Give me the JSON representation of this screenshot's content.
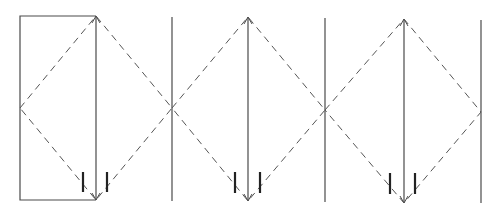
{
  "diagram": {
    "type": "geometric-line-diagram",
    "colors": {
      "line": "#4a4a4a",
      "dashed": "#555555",
      "tick": "#222222",
      "background": "#ffffff"
    },
    "rectangle": {
      "x1": 20,
      "y1": 16,
      "x2": 96,
      "y2": 200
    },
    "vertical_lines": [
      {
        "x": 96,
        "y1": 16,
        "y2": 200,
        "arrow_top": true,
        "arrow_bottom": true
      },
      {
        "x": 172,
        "y1": 17,
        "y2": 201,
        "arrow_top": false,
        "arrow_bottom": false
      },
      {
        "x": 248,
        "y1": 17,
        "y2": 201,
        "arrow_top": true,
        "arrow_bottom": true
      },
      {
        "x": 325,
        "y1": 18,
        "y2": 202,
        "arrow_top": false,
        "arrow_bottom": false
      },
      {
        "x": 404,
        "y1": 19,
        "y2": 203,
        "arrow_top": true,
        "arrow_bottom": true
      },
      {
        "x": 481,
        "y1": 20,
        "y2": 203,
        "arrow_top": false,
        "arrow_bottom": false
      }
    ],
    "diamonds": [
      {
        "left": [
          20,
          108
        ],
        "top": [
          96,
          16
        ],
        "right": [
          172,
          108
        ],
        "bottom": [
          96,
          200
        ]
      },
      {
        "left": [
          172,
          108
        ],
        "top": [
          248,
          17
        ],
        "right": [
          325,
          110
        ],
        "bottom": [
          248,
          201
        ]
      },
      {
        "left": [
          325,
          110
        ],
        "top": [
          404,
          19
        ],
        "right": [
          481,
          112
        ],
        "bottom": [
          404,
          203
        ]
      }
    ],
    "tick_marks": [
      {
        "x": 83,
        "y1": 172,
        "y2": 192
      },
      {
        "x": 107,
        "y1": 172,
        "y2": 192
      },
      {
        "x": 235,
        "y1": 172,
        "y2": 193
      },
      {
        "x": 260,
        "y1": 172,
        "y2": 193
      },
      {
        "x": 390,
        "y1": 173,
        "y2": 194
      },
      {
        "x": 415,
        "y1": 173,
        "y2": 194
      }
    ]
  }
}
